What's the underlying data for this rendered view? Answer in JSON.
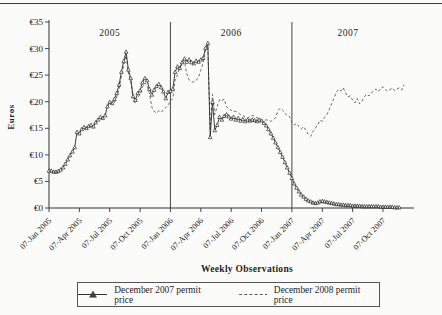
{
  "chart_data": {
    "type": "line",
    "xlabel": "Weekly Observations",
    "ylabel": "Euros",
    "ylim": [
      0,
      35
    ],
    "grid": false,
    "legend_position": "bottom",
    "y_tick_prefix": "€",
    "y_tick_values": [
      0,
      5,
      10,
      15,
      20,
      25,
      30,
      35
    ],
    "x_tick_labels": [
      "07-Jan 2005",
      "07-Apr 2005",
      "07-Jul 2005",
      "07-Oct 2005",
      "07-Jan 2006",
      "07-Apr 2006",
      "07-Jul 2006",
      "07-Oct 2006",
      "07-Jan 2007",
      "07-Apr 2007",
      "07-Jul 2007",
      "07-Oct 2007"
    ],
    "x_tick_weeks": [
      0,
      13,
      26,
      39,
      52,
      65,
      78,
      91,
      104,
      117,
      130,
      143
    ],
    "weeks_total": 152,
    "separator_weeks": [
      52,
      104
    ],
    "year_labels": [
      {
        "text": "2005",
        "week": 26
      },
      {
        "text": "2006",
        "week": 78
      },
      {
        "text": "2007",
        "week": 128
      }
    ],
    "axis_color": "#333333",
    "series": [
      {
        "name": "December 2007 permit price",
        "style": "solid-triangle",
        "color": "#2b2b2b",
        "start_week": 0,
        "values": [
          7.0,
          7.0,
          6.8,
          6.8,
          6.9,
          7.2,
          7.6,
          8.3,
          9.1,
          9.9,
          10.6,
          11.4,
          14.3,
          14.0,
          14.8,
          15.2,
          15.0,
          15.4,
          15.6,
          15.3,
          16.1,
          16.6,
          17.1,
          16.9,
          17.4,
          19.1,
          19.9,
          19.7,
          20.5,
          21.6,
          23.2,
          25.6,
          27.6,
          29.4,
          26.0,
          24.4,
          21.0,
          20.3,
          21.6,
          22.1,
          23.6,
          24.4,
          24.0,
          22.4,
          21.3,
          22.2,
          22.9,
          23.3,
          22.7,
          21.9,
          20.6,
          21.8,
          22.0,
          22.4,
          25.6,
          26.6,
          26.3,
          27.4,
          28.1,
          27.5,
          27.9,
          27.4,
          27.2,
          27.7,
          27.5,
          27.9,
          28.2,
          30.1,
          31.0,
          13.3,
          19.9,
          14.6,
          15.6,
          17.1,
          16.6,
          17.3,
          17.6,
          17.2,
          16.8,
          17.1,
          16.6,
          16.9,
          16.4,
          16.7,
          16.3,
          16.6,
          16.4,
          16.6,
          16.5,
          16.3,
          16.6,
          16.4,
          16.0,
          15.5,
          14.8,
          14.0,
          13.2,
          12.3,
          11.4,
          10.5,
          9.6,
          8.6,
          7.6,
          6.6,
          5.6,
          4.6,
          3.8,
          3.1,
          2.5,
          2.1,
          1.7,
          1.4,
          1.2,
          1.0,
          0.9,
          1.0,
          1.2,
          1.3,
          1.2,
          1.1,
          1.0,
          0.9,
          0.8,
          0.7,
          0.7,
          0.6,
          0.6,
          0.5,
          0.5,
          0.5,
          0.4,
          0.4,
          0.4,
          0.4,
          0.3,
          0.3,
          0.3,
          0.3,
          0.3,
          0.3,
          0.3,
          0.3,
          0.2,
          0.2,
          0.2,
          0.2,
          0.2,
          0.2,
          0.1,
          0.1,
          0.1
        ]
      },
      {
        "name": "December 2008 permit price",
        "style": "dashed",
        "color": "#5a5a5a",
        "start_week": 28,
        "values": [
          19.8,
          20.9,
          22.4,
          24.9,
          26.9,
          28.7,
          25.4,
          23.9,
          20.4,
          19.7,
          20.9,
          21.3,
          22.7,
          23.5,
          23.1,
          21.6,
          19.0,
          18.2,
          17.9,
          18.3,
          18.0,
          18.5,
          18.9,
          19.4,
          20.1,
          20.6,
          24.1,
          25.1,
          26.4,
          27.1,
          27.6,
          25.2,
          24.1,
          23.8,
          23.7,
          24.0,
          24.6,
          25.9,
          27.3,
          29.6,
          30.7,
          14.9,
          21.4,
          17.6,
          19.1,
          20.4,
          20.2,
          20.5,
          19.1,
          18.6,
          18.4,
          18.1,
          18.2,
          17.9,
          17.6,
          17.4,
          17.1,
          16.9,
          17.2,
          17.4,
          17.3,
          17.0,
          16.8,
          16.6,
          16.4,
          16.6,
          16.5,
          16.3,
          16.6,
          17.0,
          18.3,
          18.8,
          18.4,
          17.8,
          17.4,
          17.2,
          16.1,
          15.6,
          15.9,
          15.3,
          14.9,
          15.3,
          14.6,
          13.9,
          13.5,
          14.4,
          15.0,
          15.6,
          16.5,
          16.3,
          17.1,
          17.6,
          18.6,
          19.6,
          20.6,
          21.8,
          22.3,
          22.0,
          22.6,
          21.6,
          20.9,
          21.1,
          20.3,
          19.8,
          20.6,
          19.6,
          20.1,
          20.9,
          21.4,
          21.1,
          21.6,
          22.1,
          22.4,
          21.9,
          22.5,
          22.8,
          22.3,
          22.0,
          22.3,
          22.6,
          22.1,
          22.4,
          22.6,
          22.2,
          23.2
        ]
      }
    ]
  }
}
